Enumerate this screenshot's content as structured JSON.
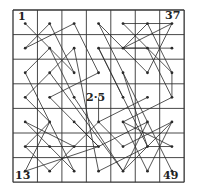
{
  "diagram": {
    "grid_size": 7,
    "origin": [
      13,
      10
    ],
    "cell_w": 24.45,
    "cell_h": 24.6,
    "line_color": "#2a2a2a",
    "grid_color": "#333333",
    "labels": [
      {
        "text": "1",
        "x": 18,
        "y": 11
      },
      {
        "text": "13",
        "x": 15,
        "y": 170
      },
      {
        "text": "2·5",
        "x": 86,
        "y": 92
      },
      {
        "text": "37",
        "x": 165,
        "y": 10
      },
      {
        "text": "49",
        "x": 163,
        "y": 170
      }
    ],
    "segments": [
      [
        [
          0,
          0
        ],
        [
          2,
          2
        ]
      ],
      [
        [
          1,
          0
        ],
        [
          0,
          1
        ]
      ],
      [
        [
          1,
          0
        ],
        [
          2,
          2
        ]
      ],
      [
        [
          2,
          0
        ],
        [
          0,
          1
        ]
      ],
      [
        [
          2,
          0
        ],
        [
          3,
          2
        ]
      ],
      [
        [
          0,
          2
        ],
        [
          1,
          1
        ]
      ],
      [
        [
          1,
          1
        ],
        [
          2,
          3
        ]
      ],
      [
        [
          0,
          2
        ],
        [
          1,
          4
        ]
      ],
      [
        [
          2,
          1
        ],
        [
          0,
          3
        ]
      ],
      [
        [
          2,
          1
        ],
        [
          3,
          6
        ]
      ],
      [
        [
          1,
          2
        ],
        [
          4,
          6
        ]
      ],
      [
        [
          1,
          3
        ],
        [
          3,
          2
        ]
      ],
      [
        [
          0,
          3
        ],
        [
          1,
          4
        ]
      ],
      [
        [
          2,
          3
        ],
        [
          4,
          6
        ]
      ],
      [
        [
          1,
          3
        ],
        [
          3,
          5
        ]
      ],
      [
        [
          0,
          4
        ],
        [
          2,
          5
        ]
      ],
      [
        [
          1,
          4
        ],
        [
          0,
          6
        ]
      ],
      [
        [
          1,
          4
        ],
        [
          2,
          6
        ]
      ],
      [
        [
          0,
          5
        ],
        [
          1,
          4
        ]
      ],
      [
        [
          0,
          5
        ],
        [
          3,
          5
        ]
      ],
      [
        [
          1,
          5
        ],
        [
          2,
          6
        ]
      ],
      [
        [
          1,
          5
        ],
        [
          0,
          4
        ]
      ],
      [
        [
          2,
          4
        ],
        [
          3,
          5
        ]
      ],
      [
        [
          0,
          6
        ],
        [
          3,
          5
        ]
      ],
      [
        [
          1,
          6
        ],
        [
          2,
          5
        ]
      ],
      [
        [
          1,
          6
        ],
        [
          0,
          5
        ]
      ],
      [
        [
          2,
          5
        ],
        [
          3,
          4
        ]
      ],
      [
        [
          3,
          0
        ],
        [
          5,
          2
        ]
      ],
      [
        [
          4,
          0
        ],
        [
          6,
          2
        ]
      ],
      [
        [
          4,
          0
        ],
        [
          6,
          0
        ]
      ],
      [
        [
          5,
          0
        ],
        [
          4,
          1
        ]
      ],
      [
        [
          5,
          0
        ],
        [
          6,
          2
        ]
      ],
      [
        [
          6,
          0
        ],
        [
          4,
          1
        ]
      ],
      [
        [
          6,
          0
        ],
        [
          5,
          2
        ]
      ],
      [
        [
          3,
          1
        ],
        [
          5,
          1
        ]
      ],
      [
        [
          3,
          1
        ],
        [
          4,
          3
        ]
      ],
      [
        [
          4,
          1
        ],
        [
          6,
          1
        ]
      ],
      [
        [
          4,
          2
        ],
        [
          5,
          5
        ]
      ],
      [
        [
          5,
          1
        ],
        [
          6,
          3
        ]
      ],
      [
        [
          3,
          0
        ],
        [
          5,
          4
        ]
      ],
      [
        [
          3,
          1
        ],
        [
          5,
          5
        ]
      ],
      [
        [
          5,
          3
        ],
        [
          3,
          4
        ]
      ],
      [
        [
          6,
          3
        ],
        [
          4,
          4
        ]
      ],
      [
        [
          6,
          2
        ],
        [
          6,
          3
        ]
      ],
      [
        [
          3,
          4
        ],
        [
          4,
          5
        ]
      ],
      [
        [
          3,
          4
        ],
        [
          3,
          3
        ]
      ],
      [
        [
          4,
          4
        ],
        [
          5,
          6
        ]
      ],
      [
        [
          4,
          4
        ],
        [
          6,
          5
        ]
      ],
      [
        [
          5,
          4
        ],
        [
          6,
          6
        ]
      ],
      [
        [
          6,
          4
        ],
        [
          4,
          5
        ]
      ],
      [
        [
          6,
          4
        ],
        [
          5,
          6
        ]
      ],
      [
        [
          5,
          5
        ],
        [
          6,
          5
        ]
      ],
      [
        [
          4,
          6
        ],
        [
          6,
          4
        ]
      ],
      [
        [
          3,
          5
        ],
        [
          5,
          4
        ]
      ],
      [
        [
          4,
          6
        ],
        [
          5,
          4
        ]
      ],
      [
        [
          3,
          6
        ],
        [
          5,
          5
        ]
      ]
    ]
  }
}
